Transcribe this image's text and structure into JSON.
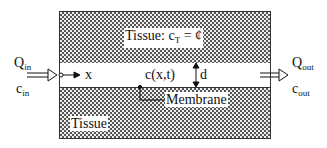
{
  "diagram": {
    "top_tissue_label": "Tissue: c",
    "top_tissue_sub": "T",
    "top_tissue_eq": " = ¢",
    "bottom_tissue_label": "Tissue",
    "inflow": {
      "flow_label": "Q",
      "flow_sub": "in",
      "conc_label": "c",
      "conc_sub": "in"
    },
    "outflow": {
      "flow_label": "Q",
      "flow_sub": "out",
      "conc_label": "c",
      "conc_sub": "out"
    },
    "axis_label": "x",
    "channel_concentration": "c(x,t)",
    "width_label": "d",
    "membrane_label": "Membrane",
    "colors": {
      "hatch": "#555555",
      "line": "#111111",
      "background": "#ffffff"
    }
  }
}
